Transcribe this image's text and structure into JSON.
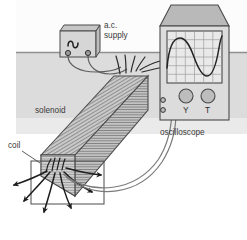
{
  "diagram": {
    "labels": {
      "ac_supply_line1": "a.c.",
      "ac_supply_line2": "supply",
      "solenoid": "solenoid",
      "coil": "coil",
      "oscilloscope": "oscilloscope",
      "knob_y": "Y",
      "knob_t": "T"
    },
    "components": {
      "ac_supply": {
        "name": "a.c. supply",
        "symbol": "sine-wave",
        "terminals": 2
      },
      "solenoid": {
        "name": "solenoid",
        "shape": "rectangular-prism",
        "winding_style": "horizontal-hatching",
        "lead_wires": 2
      },
      "search_coil": {
        "name": "coil",
        "shape": "rectangle-outline",
        "lead_wires": 2
      },
      "oscilloscope": {
        "name": "oscilloscope",
        "screen": {
          "grid_columns": 6,
          "grid_rows": 6,
          "trace": "sine-wave",
          "trace_cycles": 2.5
        },
        "knobs": [
          "Y",
          "T"
        ],
        "input_terminals": 2
      },
      "field_lines": {
        "name": "magnetic field lines",
        "count": 6,
        "arrowheads": true
      }
    },
    "background": {
      "bench_surface": "#d9d9d9",
      "wall": "#fbfbfb",
      "bench_edge_y": 52
    },
    "colors": {
      "outline": "#4a4a4a",
      "body_fill": "#d4d4d4",
      "body_fill_dark": "#b8b8b8",
      "screen_fill": "#e8e8e8",
      "wire": "#6b6b6b",
      "field_line": "#222222",
      "label_text": "#3a3a3a"
    }
  }
}
